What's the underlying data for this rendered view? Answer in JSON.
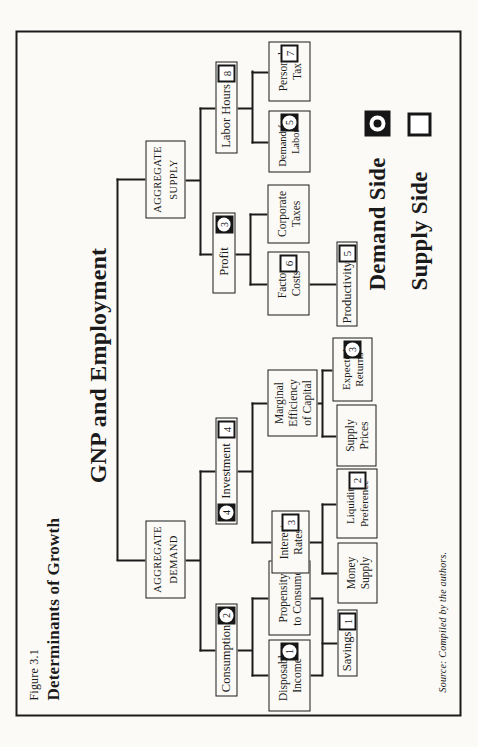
{
  "figure": {
    "number": "Figure 3.1",
    "title": "Determinants of Growth",
    "diagram_title": "GNP and Employment",
    "source_note": "Source: Compiled by the authors."
  },
  "legend": {
    "items": [
      {
        "label": "Demand Side",
        "type": "demand"
      },
      {
        "label": "Supply Side",
        "type": "supply"
      }
    ]
  },
  "colors": {
    "ink": "#1b1b1b",
    "paper": "#fbfaf6",
    "badge_demand_bg": "#161616",
    "badge_fill": "#ffffff"
  },
  "tree": {
    "nodes": [
      {
        "id": "aggregate-demand",
        "lines": [
          "AGGREGATE",
          "DEMAND"
        ],
        "parents": [
          "root"
        ]
      },
      {
        "id": "aggregate-supply",
        "lines": [
          "AGGREGATE",
          "SUPPLY"
        ],
        "parents": [
          "root"
        ]
      },
      {
        "id": "consumption",
        "lines": [
          "Consumption"
        ],
        "badge_right": {
          "type": "demand",
          "num": "2"
        },
        "parents": [
          "aggregate-demand"
        ]
      },
      {
        "id": "investment",
        "lines": [
          "Investment"
        ],
        "badge_left": {
          "type": "demand",
          "num": "4"
        },
        "badge_right": {
          "type": "supply",
          "num": "4"
        },
        "parents": [
          "aggregate-demand"
        ]
      },
      {
        "id": "profit",
        "lines": [
          "Profit"
        ],
        "badge_right": {
          "type": "demand",
          "num": "3"
        },
        "parents": [
          "aggregate-supply"
        ]
      },
      {
        "id": "labor-hours",
        "lines": [
          "Labor Hours"
        ],
        "badge_right": {
          "type": "supply",
          "num": "8"
        },
        "parents": [
          "aggregate-supply"
        ]
      },
      {
        "id": "disposable-income",
        "lines": [
          "Disposable",
          "Income"
        ],
        "badge_right": {
          "type": "demand",
          "num": "1"
        },
        "parents": [
          "consumption"
        ]
      },
      {
        "id": "propensity-to-consume",
        "lines": [
          "Propensity",
          "to Consume"
        ],
        "parents": [
          "consumption"
        ]
      },
      {
        "id": "interest-rates",
        "lines": [
          "Interest",
          "Rates"
        ],
        "badge_right": {
          "type": "supply",
          "num": "3"
        },
        "parents": [
          "investment"
        ]
      },
      {
        "id": "marginal-efficiency-of-capital",
        "lines": [
          "Marginal",
          "Efficiency",
          "of Capital"
        ],
        "parents": [
          "investment"
        ]
      },
      {
        "id": "factor-costs",
        "lines": [
          "Factor",
          "Costs"
        ],
        "badge_right": {
          "type": "supply",
          "num": "6"
        },
        "parents": [
          "profit"
        ]
      },
      {
        "id": "corporate-taxes",
        "lines": [
          "Corporate",
          "Taxes"
        ],
        "parents": [
          "profit"
        ]
      },
      {
        "id": "demand-for-labor",
        "lines": [
          "Demand for",
          "Labor"
        ],
        "badge_right": {
          "type": "demand",
          "num": "5"
        },
        "parents": [
          "labor-hours"
        ]
      },
      {
        "id": "personal-tax",
        "lines": [
          "Personal",
          "Tax"
        ],
        "badge_right": {
          "type": "supply",
          "num": "7"
        },
        "parents": [
          "labor-hours"
        ]
      },
      {
        "id": "savings",
        "lines": [
          "Savings"
        ],
        "badge_right": {
          "type": "supply",
          "num": "1"
        },
        "parents": [
          "disposable-income",
          "propensity-to-consume"
        ]
      },
      {
        "id": "money-supply",
        "lines": [
          "Money",
          "Supply"
        ],
        "parents": [
          "interest-rates"
        ]
      },
      {
        "id": "liquidity-preference",
        "lines": [
          "Liquidity",
          "Preference"
        ],
        "badge_right": {
          "type": "supply",
          "num": "2"
        },
        "parents": [
          "interest-rates"
        ]
      },
      {
        "id": "supply-prices",
        "lines": [
          "Supply",
          "Prices"
        ],
        "parents": [
          "marginal-efficiency-of-capital"
        ]
      },
      {
        "id": "expected-returns",
        "lines": [
          "Expected",
          "Returns"
        ],
        "badge_right": {
          "type": "demand",
          "num": "3"
        },
        "parents": [
          "marginal-efficiency-of-capital"
        ]
      },
      {
        "id": "productivity",
        "lines": [
          "Productivity"
        ],
        "badge_right": {
          "type": "supply",
          "num": "5"
        },
        "parents": [
          "factor-costs"
        ]
      }
    ]
  }
}
